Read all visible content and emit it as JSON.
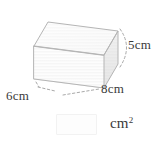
{
  "figure": {
    "shape_name": "rectangular-prism",
    "colors": {
      "front_face": "#f4f4f4",
      "right_face": "#d8d8d8",
      "top_face": "#fafafa",
      "edge_stroke": "#b8b8b8",
      "hidden_edge_stroke": "#d2d2d2",
      "leader_line": "#9a9a9a",
      "label_text": "#3a3a3a"
    },
    "labels": {
      "width": "6cm",
      "depth": "8cm",
      "height": "5cm"
    }
  },
  "answer": {
    "value": "",
    "placeholder": "",
    "unit": "cm",
    "unit_exponent": "2"
  }
}
